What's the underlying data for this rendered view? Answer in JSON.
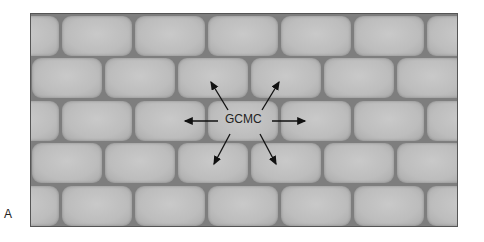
{
  "figure": {
    "panel_label": "A",
    "center_label": "GCMC",
    "arrows": [
      "up-left",
      "up-right",
      "left",
      "right",
      "down-left",
      "down-right"
    ],
    "colors": {
      "brick": "#bdbdbd",
      "mortar": "#7e7e7e",
      "border": "#555555",
      "text": "#222222"
    },
    "rows": 5
  }
}
